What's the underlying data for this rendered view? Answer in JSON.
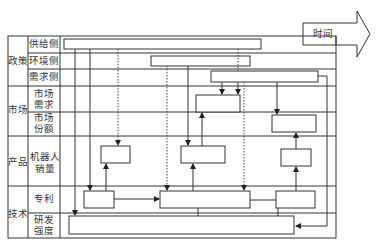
{
  "diagram": {
    "time_arrow_label": "时间",
    "categories": [
      {
        "label": "政策",
        "rows": [
          "供给侧",
          "环境侧",
          "需求侧"
        ]
      },
      {
        "label": "市场",
        "rows": [
          "市场需求",
          "市场份额"
        ]
      },
      {
        "label": "产品",
        "rows": [
          "机器人销量"
        ]
      },
      {
        "label": "技术",
        "rows": [
          "专利",
          "研发强度"
        ]
      }
    ],
    "labels": {
      "policy": "政策",
      "supply_side": "供给侧",
      "environment_side": "环境侧",
      "demand_side": "需求侧",
      "market": "市场",
      "market_demand_1": "市场",
      "market_demand_2": "需求",
      "market_share_1": "市场",
      "market_share_2": "份额",
      "product": "产品",
      "robot_sales_1": "机器人",
      "robot_sales_2": "销量",
      "technology": "技术",
      "patent": "专利",
      "rd_intensity_1": "研发",
      "rd_intensity_2": "强度"
    },
    "colors": {
      "line": "#333333",
      "background": "#ffffff"
    }
  }
}
